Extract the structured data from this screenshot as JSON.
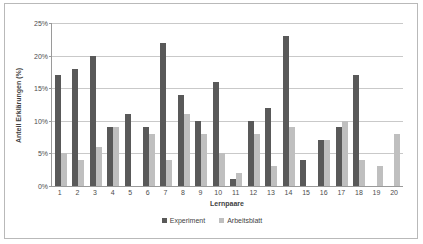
{
  "chart_data": {
    "type": "bar",
    "title": "",
    "xlabel": "Lernpaare",
    "ylabel": "Anteil Erklärungen (%)",
    "ylim": [
      0,
      25
    ],
    "yticks": [
      "0%",
      "5%",
      "10%",
      "15%",
      "20%",
      "25%"
    ],
    "ytick_values": [
      0,
      5,
      10,
      15,
      20,
      25
    ],
    "grid": true,
    "legend_position": "bottom",
    "categories": [
      "1",
      "2",
      "3",
      "4",
      "5",
      "6",
      "7",
      "8",
      "9",
      "10",
      "11",
      "12",
      "13",
      "14",
      "15",
      "16",
      "17",
      "18",
      "19",
      "20"
    ],
    "series": [
      {
        "name": "Experiment",
        "color": "#595959",
        "values": [
          17,
          18,
          20,
          9,
          11,
          9,
          22,
          14,
          10,
          16,
          1,
          10,
          12,
          23,
          4,
          7,
          9,
          17,
          0,
          0
        ]
      },
      {
        "name": "Arbeitsblatt",
        "color": "#bfbfbf",
        "values": [
          5,
          4,
          6,
          9,
          0,
          8,
          4,
          11,
          8,
          5,
          2,
          8,
          3,
          9,
          0,
          7,
          10,
          4,
          3,
          8
        ]
      }
    ]
  },
  "legend": {
    "items": [
      {
        "label": "Experiment",
        "color": "#595959"
      },
      {
        "label": "Arbeitsblatt",
        "color": "#bfbfbf"
      }
    ]
  }
}
